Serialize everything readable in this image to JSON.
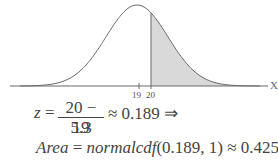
{
  "chart_data": {
    "type": "area",
    "title": "",
    "xlabel": "X",
    "ylabel": "",
    "distribution": {
      "mean": 19,
      "std_dev": 5.3
    },
    "tick_labels": [
      "19",
      "20"
    ],
    "ticks": [
      19,
      20
    ],
    "shaded_region": {
      "from": 20,
      "to": "infinity",
      "area": 0.425
    },
    "colors": {
      "curve": "#6b6b6b",
      "shade": "#d9d9d9",
      "axis": "#6b6b6b"
    },
    "grid": false
  },
  "equation": {
    "z_var": "z",
    "equals": "=",
    "numerator": "20 − 19",
    "denominator": "5.3",
    "approx_result": "≈ 0.189 ⇒",
    "area_label": "Area",
    "area_expr": "= normalcdf(0.189, 1) ≈ 0.4250",
    "area_func": "normalcdf",
    "area_args": "(0.189, 1)",
    "area_result": "≈ 0.4250"
  }
}
